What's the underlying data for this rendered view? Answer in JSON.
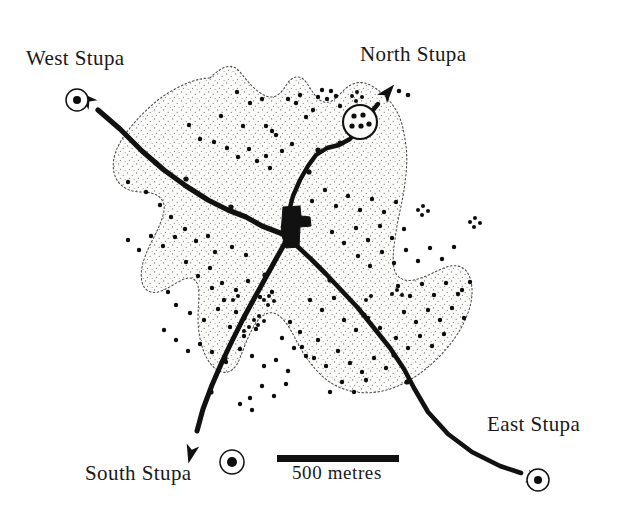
{
  "figure": {
    "kind": "archaeological-site-map",
    "background_color": "#ffffff",
    "ink_color": "#111111",
    "site_fill_color": "#fbfbfa",
    "stipple_color": "#6f6f6f",
    "boundary_color": "#555555"
  },
  "labels": {
    "west_stupa": "West Stupa",
    "north_stupa": "North Stupa",
    "south_stupa": "South Stupa",
    "east_stupa": "East Stupa"
  },
  "scale_bar": {
    "caption": "500 metres",
    "length_px": 122,
    "x": 277,
    "y": 455,
    "thickness_px": 7
  },
  "stupa_markers": [
    {
      "name": "West Stupa",
      "x": 77,
      "y": 100,
      "outer_r": 11,
      "inner_r": 4
    },
    {
      "name": "South Stupa",
      "x": 232,
      "y": 462,
      "outer_r": 12,
      "inner_r": 5
    },
    {
      "name": "East Stupa",
      "x": 538,
      "y": 480,
      "outer_r": 11,
      "inner_r": 4
    }
  ],
  "north_enclosure": {
    "name": "North Stupa enclosure",
    "cx": 360,
    "cy": 122,
    "r": 17,
    "interior_dots": [
      [
        354,
        116
      ],
      [
        363,
        115
      ],
      [
        352,
        126
      ],
      [
        361,
        126
      ],
      [
        369,
        124
      ]
    ]
  },
  "central_monument": {
    "name": "central monument block",
    "points": "283,207 300,206 301,216 310,217 311,226 300,227 299,247 286,248 281,233"
  },
  "roads": [
    {
      "name": "north-west road to West Stupa",
      "path": "M 288,236 L 262,226 L 246,217 L 228,210 L 208,200 L 186,186 L 164,170 L 142,151 L 120,129 L 98,110",
      "width": 5.2,
      "arrow_at": [
        93,
        105
      ],
      "arrow_angle": -137
    },
    {
      "name": "north road to North Stupa",
      "path": "M 289,211 L 293,196 L 300,180 L 308,166 L 316,155 L 327,148 L 339,145 L 350,139 L 358,128 L 368,116 L 378,104",
      "width": 4.4,
      "arrow_at": [
        382,
        99
      ],
      "arrow_angle": -50
    },
    {
      "name": "south-west road to South Stupa",
      "path": "M 285,243 L 276,259 L 266,277 L 255,297 L 243,319 L 232,341 L 222,362 L 212,385 L 203,409 L 197,431",
      "width": 5.0,
      "arrow_at": [
        193,
        445
      ],
      "arrow_angle": 104
    },
    {
      "name": "south-east road to East Stupa",
      "path": "M 297,246 L 311,259 L 326,274 L 342,291 L 358,308 L 374,328 L 390,348 L 404,369 L 414,388 L 428,412 L 448,434 L 472,452 L 500,466 L 521,473",
      "width": 4.6,
      "arrow_at": [
        527,
        476
      ],
      "arrow_angle": 18
    }
  ],
  "road_tick_marks": [
    [
      231,
      207
    ],
    [
      186,
      179
    ],
    [
      156,
      163
    ],
    [
      309,
      172
    ],
    [
      318,
      150
    ],
    [
      340,
      143
    ],
    [
      265,
      275
    ],
    [
      244,
      318
    ],
    [
      225,
      358
    ],
    [
      211,
      392
    ],
    [
      330,
      280
    ],
    [
      364,
      315
    ],
    [
      394,
      355
    ],
    [
      407,
      382
    ]
  ],
  "site_boundary": {
    "name": "site extent boundary",
    "style": "dotted-irregular",
    "path": "M 210,78 C 222,66 232,62 240,72 C 248,82 256,92 266,96 C 276,100 282,92 287,84 C 292,76 300,74 306,82 C 312,90 316,100 324,102 C 332,104 338,96 344,90 C 352,82 362,80 372,86 C 382,92 390,100 396,110 C 402,120 404,132 406,146 C 408,160 406,176 404,190 C 402,204 398,218 396,232 C 394,246 392,258 394,268 C 396,278 404,282 414,280 C 424,278 434,272 444,268 C 456,263 466,266 470,278 C 474,290 472,304 466,318 C 460,332 450,346 438,358 C 426,370 412,380 398,386 C 384,392 370,394 356,392 C 342,390 330,384 320,374 C 310,364 302,352 296,340 C 290,328 284,318 276,314 C 268,310 260,316 254,326 C 248,336 244,348 240,358 C 236,368 230,374 222,372 C 214,370 208,362 204,352 C 200,342 198,330 198,318 C 198,306 200,294 198,286 C 196,278 190,276 182,280 C 174,284 166,290 158,292 C 150,294 144,290 142,282 C 140,274 142,264 146,254 C 150,244 156,234 160,224 C 164,214 166,206 162,200 C 158,194 150,192 142,192 C 134,192 126,190 120,184 C 114,178 112,168 114,158 C 116,148 122,138 130,128 C 138,118 148,108 158,100 C 168,92 180,86 190,82 C 198,79 205,78 210,78 Z"
  },
  "outlier_dots": [
    [
      399,
      91
    ],
    [
      408,
      95
    ]
  ],
  "structure_dots": [
    [
      221,
      116
    ],
    [
      237,
      92
    ],
    [
      250,
      103
    ],
    [
      243,
      126
    ],
    [
      262,
      99
    ],
    [
      266,
      126
    ],
    [
      272,
      131
    ],
    [
      276,
      135
    ],
    [
      288,
      99
    ],
    [
      296,
      103
    ],
    [
      300,
      95
    ],
    [
      306,
      117
    ],
    [
      313,
      110
    ],
    [
      318,
      97
    ],
    [
      322,
      90
    ],
    [
      327,
      99
    ],
    [
      331,
      91
    ],
    [
      336,
      96
    ],
    [
      340,
      106
    ],
    [
      189,
      125
    ],
    [
      200,
      139
    ],
    [
      214,
      142
    ],
    [
      227,
      148
    ],
    [
      238,
      157
    ],
    [
      249,
      149
    ],
    [
      257,
      161
    ],
    [
      266,
      156
    ],
    [
      270,
      168
    ],
    [
      282,
      151
    ],
    [
      292,
      144
    ],
    [
      128,
      182
    ],
    [
      146,
      192
    ],
    [
      160,
      205
    ],
    [
      171,
      217
    ],
    [
      185,
      229
    ],
    [
      196,
      241
    ],
    [
      208,
      236
    ],
    [
      215,
      252
    ],
    [
      232,
      247
    ],
    [
      246,
      255
    ],
    [
      186,
      262
    ],
    [
      198,
      276
    ],
    [
      210,
      268
    ],
    [
      222,
      283
    ],
    [
      236,
      290
    ],
    [
      248,
      281
    ],
    [
      260,
      297
    ],
    [
      272,
      292
    ],
    [
      168,
      292
    ],
    [
      176,
      305
    ],
    [
      190,
      313
    ],
    [
      204,
      320
    ],
    [
      218,
      309
    ],
    [
      230,
      327
    ],
    [
      244,
      336
    ],
    [
      256,
      329
    ],
    [
      200,
      344
    ],
    [
      212,
      352
    ],
    [
      226,
      362
    ],
    [
      240,
      349
    ],
    [
      252,
      356
    ],
    [
      264,
      366
    ],
    [
      276,
      360
    ],
    [
      288,
      371
    ],
    [
      302,
      347
    ],
    [
      314,
      358
    ],
    [
      326,
      366
    ],
    [
      338,
      351
    ],
    [
      350,
      363
    ],
    [
      362,
      372
    ],
    [
      374,
      358
    ],
    [
      386,
      368
    ],
    [
      312,
      201
    ],
    [
      325,
      190
    ],
    [
      336,
      206
    ],
    [
      348,
      196
    ],
    [
      360,
      210
    ],
    [
      372,
      199
    ],
    [
      384,
      212
    ],
    [
      396,
      202
    ],
    [
      332,
      232
    ],
    [
      344,
      243
    ],
    [
      356,
      228
    ],
    [
      368,
      240
    ],
    [
      380,
      226
    ],
    [
      392,
      238
    ],
    [
      404,
      229
    ],
    [
      358,
      256
    ],
    [
      370,
      266
    ],
    [
      382,
      252
    ],
    [
      394,
      263
    ],
    [
      406,
      250
    ],
    [
      418,
      261
    ],
    [
      430,
      248
    ],
    [
      442,
      259
    ],
    [
      454,
      247
    ],
    [
      398,
      286
    ],
    [
      410,
      296
    ],
    [
      422,
      284
    ],
    [
      434,
      295
    ],
    [
      446,
      283
    ],
    [
      458,
      294
    ],
    [
      470,
      282
    ],
    [
      462,
      290
    ],
    [
      404,
      312
    ],
    [
      416,
      322
    ],
    [
      428,
      310
    ],
    [
      440,
      320
    ],
    [
      452,
      308
    ],
    [
      464,
      318
    ],
    [
      396,
      338
    ],
    [
      408,
      348
    ],
    [
      420,
      336
    ],
    [
      432,
      346
    ],
    [
      444,
      334
    ],
    [
      344,
      320
    ],
    [
      356,
      330
    ],
    [
      368,
      318
    ],
    [
      380,
      328
    ],
    [
      310,
      300
    ],
    [
      322,
      310
    ],
    [
      334,
      298
    ],
    [
      290,
      322
    ],
    [
      300,
      332
    ],
    [
      282,
      338
    ],
    [
      294,
      348
    ],
    [
      306,
      356
    ],
    [
      318,
      340
    ],
    [
      330,
      392
    ],
    [
      342,
      382
    ],
    [
      354,
      392
    ],
    [
      366,
      380
    ],
    [
      262,
      386
    ],
    [
      274,
      396
    ],
    [
      286,
      384
    ],
    [
      250,
      398
    ],
    [
      224,
      300
    ],
    [
      236,
      312
    ],
    [
      212,
      288
    ],
    [
      188,
      351
    ],
    [
      176,
      340
    ],
    [
      164,
      330
    ],
    [
      240,
      404
    ],
    [
      252,
      410
    ],
    [
      151,
      236
    ],
    [
      163,
      246
    ],
    [
      175,
      237
    ],
    [
      139,
      250
    ],
    [
      128,
      240
    ]
  ],
  "structure_clusters": [
    [
      352,
      96
    ],
    [
      357,
      92
    ],
    [
      362,
      97
    ],
    [
      356,
      101
    ],
    [
      418,
      210
    ],
    [
      423,
      206
    ],
    [
      428,
      211
    ],
    [
      422,
      215
    ],
    [
      470,
      222
    ],
    [
      475,
      218
    ],
    [
      480,
      223
    ],
    [
      474,
      227
    ],
    [
      264,
      300
    ],
    [
      269,
      296
    ],
    [
      274,
      301
    ],
    [
      268,
      305
    ],
    [
      254,
      320
    ],
    [
      259,
      316
    ],
    [
      264,
      321
    ],
    [
      258,
      325
    ],
    [
      249,
      327
    ],
    [
      244,
      331
    ],
    [
      392,
      294
    ],
    [
      397,
      290
    ],
    [
      402,
      295
    ],
    [
      366,
      300
    ],
    [
      371,
      296
    ],
    [
      238,
      296
    ],
    [
      233,
      300
    ]
  ]
}
